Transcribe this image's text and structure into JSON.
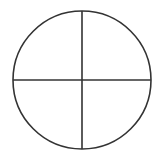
{
  "diagram": {
    "shape": "circle-divided-into-quadrants",
    "stroke_color": "#333333",
    "background_color": "#ffffff",
    "center": [
      82,
      80
    ],
    "radius": 69,
    "stroke_width": 1.6
  }
}
